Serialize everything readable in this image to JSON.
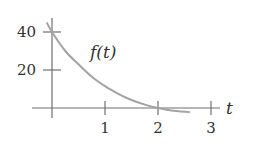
{
  "chart_data": {
    "type": "line",
    "title": "",
    "xlabel": "t",
    "ylabel": "",
    "curve_label": "f(t)",
    "x_ticks": [
      1,
      2,
      3
    ],
    "y_ticks": [
      20,
      40
    ],
    "x_tick_labels": [
      "1",
      "2",
      "3"
    ],
    "y_tick_labels": [
      "20",
      "40"
    ],
    "xlim": [
      0,
      3.3
    ],
    "ylim": [
      0,
      47
    ],
    "grid": false,
    "legend": "none",
    "series": [
      {
        "name": "f(t)",
        "x": [
          -0.1,
          0,
          0.25,
          0.5,
          0.75,
          1.0,
          1.25,
          1.5,
          1.75,
          2.0,
          2.25,
          2.6
        ],
        "values": [
          45,
          40,
          30,
          23,
          16.5,
          11.5,
          7.5,
          4.2,
          1.8,
          0,
          -1.3,
          -2.2
        ]
      }
    ],
    "colors": {
      "axis": "#6f6f6f",
      "curve": "#a3a3a3",
      "text": "#333333"
    }
  }
}
